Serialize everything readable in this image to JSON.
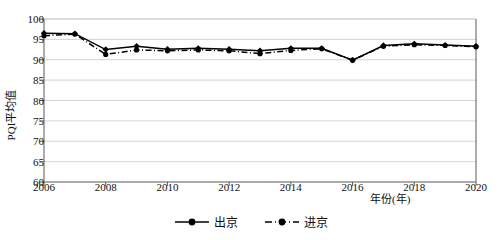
{
  "figure": {
    "background_color": "#ffffff",
    "line_color": "#000000",
    "grid_color": "#c8c8c8",
    "axis_color": "#595959"
  },
  "chart_data": {
    "type": "line",
    "title": "",
    "xlabel": "年份(年)",
    "ylabel": "PQI平均值",
    "xlim": [
      2006,
      2020
    ],
    "ylim": [
      60,
      100
    ],
    "ytick_labels": [
      "60",
      "65",
      "70",
      "75",
      "80",
      "85",
      "90",
      "95",
      "100"
    ],
    "ytick_values": [
      60,
      65,
      70,
      75,
      80,
      85,
      90,
      95,
      100
    ],
    "xtick_labels": [
      "2006",
      "2008",
      "2010",
      "2012",
      "2014",
      "2016",
      "2018",
      "2020"
    ],
    "xtick_values": [
      2006,
      2008,
      2010,
      2012,
      2014,
      2016,
      2018,
      2020
    ],
    "grid": "horizontal",
    "legend_position": "bottom-center",
    "x": [
      2006,
      2007,
      2008,
      2009,
      2010,
      2011,
      2012,
      2013,
      2014,
      2015,
      2016,
      2017,
      2018,
      2019,
      2020
    ],
    "series": [
      {
        "name": "出京",
        "style": "solid",
        "marker": "filled-diamond",
        "values": [
          96.5,
          96.4,
          92.5,
          93.3,
          92.6,
          92.8,
          92.6,
          92.2,
          92.8,
          92.8,
          89.9,
          93.5,
          93.9,
          93.6,
          93.3
        ]
      },
      {
        "name": "进京",
        "style": "dash-dot",
        "marker": "filled-circle",
        "values": [
          95.9,
          96.3,
          91.3,
          92.4,
          92.2,
          92.4,
          92.2,
          91.5,
          92.3,
          92.7,
          89.9,
          93.3,
          93.7,
          93.5,
          93.2
        ]
      }
    ]
  },
  "legend": {
    "items": [
      {
        "label": "出京",
        "style": "solid"
      },
      {
        "label": "进京",
        "style": "dash-dot"
      }
    ]
  }
}
